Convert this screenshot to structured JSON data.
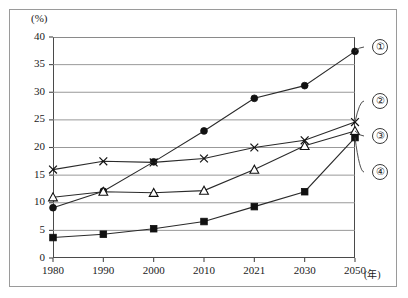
{
  "figure": {
    "unit_label": "(%)",
    "xaxis_unit": "(年)"
  },
  "axes": {
    "y_ticks": [
      "0",
      "5",
      "10",
      "15",
      "20",
      "25",
      "30",
      "35",
      "40"
    ],
    "x_ticks": [
      "1980",
      "1990",
      "2000",
      "2010",
      "2021",
      "2030",
      "2050"
    ]
  },
  "legend": {
    "items": [
      {
        "marker": "filled-circle",
        "label": "①"
      },
      {
        "marker": "cross",
        "label": "②"
      },
      {
        "marker": "open-triangle",
        "label": "③"
      },
      {
        "marker": "filled-square",
        "label": "④"
      }
    ]
  },
  "chart_data": {
    "type": "line",
    "title": "",
    "subtitle": "",
    "xlabel": "(年)",
    "ylabel": "(%)",
    "xlim": [
      1980,
      2050
    ],
    "ylim": [
      0,
      40
    ],
    "grid": true,
    "legend_position": "right-outside",
    "categories": [
      "1980",
      "1990",
      "2000",
      "2010",
      "2021",
      "2030",
      "2050"
    ],
    "series": [
      {
        "name": "①",
        "marker": "filled-circle",
        "values": [
          9.1,
          12.1,
          17.4,
          23.0,
          28.9,
          31.2,
          37.4
        ]
      },
      {
        "name": "②",
        "marker": "cross",
        "values": [
          16.0,
          17.5,
          17.3,
          18.0,
          20.0,
          21.3,
          24.6
        ]
      },
      {
        "name": "③",
        "marker": "open-triangle",
        "values": [
          11.0,
          12.0,
          11.8,
          12.2,
          16.0,
          20.3,
          23.0
        ]
      },
      {
        "name": "④",
        "marker": "filled-square",
        "values": [
          3.7,
          4.3,
          5.3,
          6.6,
          9.3,
          12.0,
          21.8
        ]
      }
    ]
  }
}
